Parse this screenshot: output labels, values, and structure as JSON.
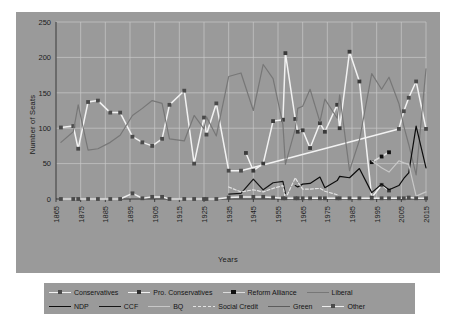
{
  "chart_data": {
    "type": "line",
    "title": "",
    "xlabel": "Years",
    "ylabel": "Number of Seats",
    "xlim": [
      1865,
      2015
    ],
    "ylim": [
      0,
      250
    ],
    "yticks": [
      0,
      50,
      100,
      150,
      200,
      250
    ],
    "xticks": [
      1865,
      1875,
      1885,
      1895,
      1905,
      1915,
      1925,
      1935,
      1945,
      1955,
      1965,
      1975,
      1985,
      1995,
      2005,
      2015
    ],
    "grid": true,
    "legend_position": "bottom",
    "background_color": "#9a9a9a",
    "series": [
      {
        "name": "Conservatives",
        "color": "#f2f2f2",
        "marker": "square",
        "marker_color": "#4a4a4a",
        "style": "solid",
        "x": [
          1867,
          1872,
          1874,
          1878,
          1882,
          1887,
          1891,
          1896,
          1900,
          1904,
          1908,
          1911,
          1917,
          1921,
          1925,
          1926,
          1930,
          1935,
          1940,
          2004,
          2006,
          2008,
          2011,
          2015
        ],
        "y": [
          101,
          103,
          71,
          137,
          139,
          122,
          122,
          88,
          80,
          75,
          85,
          133,
          153,
          50,
          115,
          91,
          135,
          40,
          40,
          99,
          124,
          143,
          166,
          99
        ]
      },
      {
        "name": "Pro. Conservatives",
        "color": "#f2f2f2",
        "marker": "square",
        "marker_color": "#3a3a3a",
        "style": "solid",
        "x": [
          1942,
          1945,
          1949,
          1953,
          1957,
          1958,
          1962,
          1963,
          1965,
          1968,
          1972,
          1974,
          1979,
          1980,
          1984,
          1988,
          1993,
          1997,
          2000
        ],
        "y": [
          65,
          40,
          50,
          110,
          112,
          206,
          113,
          95,
          97,
          72,
          107,
          95,
          133,
          100,
          208,
          166,
          2,
          20,
          12
        ]
      },
      {
        "name": "Reform Alliance",
        "color": "#dcdcdc",
        "marker": "square",
        "marker_color": "#101010",
        "style": "solid",
        "x": [
          1993,
          1997,
          2000
        ],
        "y": [
          52,
          60,
          66
        ]
      },
      {
        "name": "Liberal",
        "color": "#777777",
        "marker": "none",
        "style": "solid",
        "x": [
          1867,
          1872,
          1874,
          1878,
          1882,
          1887,
          1891,
          1896,
          1900,
          1904,
          1908,
          1911,
          1917,
          1921,
          1925,
          1926,
          1930,
          1935,
          1940,
          1945,
          1949,
          1953,
          1957,
          1958,
          1962,
          1963,
          1965,
          1968,
          1972,
          1974,
          1979,
          1980,
          1984,
          1988,
          1993,
          1997,
          2000,
          2004,
          2006,
          2008,
          2011,
          2015
        ],
        "y": [
          80,
          95,
          133,
          69,
          71,
          80,
          90,
          118,
          128,
          139,
          135,
          85,
          82,
          118,
          99,
          116,
          89,
          173,
          178,
          125,
          190,
          170,
          105,
          49,
          99,
          128,
          131,
          155,
          109,
          141,
          114,
          147,
          40,
          83,
          177,
          155,
          172,
          135,
          103,
          77,
          34,
          184
        ]
      },
      {
        "name": "NDP",
        "color": "#0d0d0d",
        "marker": "none",
        "style": "solid",
        "x": [
          1962,
          1963,
          1965,
          1968,
          1972,
          1974,
          1979,
          1980,
          1984,
          1988,
          1993,
          1997,
          2000,
          2004,
          2006,
          2008,
          2011,
          2015
        ],
        "y": [
          19,
          17,
          21,
          22,
          31,
          16,
          26,
          32,
          30,
          43,
          9,
          21,
          13,
          19,
          29,
          37,
          103,
          44
        ]
      },
      {
        "name": "CCF",
        "color": "#161616",
        "marker": "none",
        "style": "solid",
        "x": [
          1935,
          1940,
          1945,
          1949,
          1953,
          1957,
          1958
        ],
        "y": [
          7,
          8,
          28,
          13,
          23,
          25,
          8
        ]
      },
      {
        "name": "BQ",
        "color": "#c8c8c8",
        "marker": "none",
        "style": "solid",
        "x": [
          1993,
          1997,
          2000,
          2004,
          2006,
          2008,
          2011,
          2015
        ],
        "y": [
          54,
          44,
          38,
          54,
          51,
          49,
          4,
          10
        ]
      },
      {
        "name": "Social Credit",
        "color": "#e4e4e4",
        "marker": "none",
        "style": "dashed",
        "x": [
          1935,
          1940,
          1945,
          1949,
          1953,
          1957,
          1958,
          1962,
          1963,
          1965,
          1968,
          1972,
          1974,
          1979,
          1980
        ],
        "y": [
          17,
          10,
          13,
          10,
          15,
          19,
          0,
          30,
          24,
          14,
          14,
          15,
          11,
          6,
          0
        ]
      },
      {
        "name": "Green",
        "color": "#5c5c5c",
        "marker": "none",
        "style": "solid",
        "x": [
          2008,
          2011,
          2015
        ],
        "y": [
          0,
          1,
          1
        ]
      },
      {
        "name": "Other",
        "color": "#ededed",
        "marker": "square",
        "marker_color": "#4a4a4a",
        "style": "solid",
        "x": [
          1867,
          1872,
          1874,
          1878,
          1882,
          1887,
          1891,
          1896,
          1900,
          1904,
          1908,
          1911,
          1917,
          1921,
          1925,
          1926,
          1930,
          1935,
          1940,
          1945,
          1949,
          1953,
          1957,
          1958,
          1962,
          1963,
          1965,
          1968,
          1972,
          1974,
          1979,
          1980,
          1984,
          1988,
          1993,
          1997,
          2000,
          2004,
          2006,
          2008,
          2011,
          2015
        ],
        "y": [
          0,
          0,
          0,
          0,
          0,
          0,
          0,
          8,
          1,
          3,
          3,
          0,
          0,
          0,
          0,
          0,
          0,
          2,
          3,
          3,
          3,
          2,
          1,
          1,
          1,
          1,
          1,
          1,
          1,
          1,
          1,
          1,
          1,
          1,
          1,
          1,
          1,
          1,
          1,
          2,
          1,
          1
        ]
      }
    ]
  },
  "axes": {
    "y_title": "Number of Seats",
    "x_title": "Years",
    "y_ticks": [
      "0",
      "50",
      "100",
      "150",
      "200",
      "250"
    ],
    "x_ticks": [
      "1865",
      "1875",
      "1885",
      "1895",
      "1905",
      "1915",
      "1925",
      "1935",
      "1945",
      "1955",
      "1965",
      "1975",
      "1985",
      "1995",
      "2005",
      "2015"
    ]
  },
  "legend": {
    "row1": [
      {
        "label": "Conservatives",
        "color": "#f2f2f2",
        "marker_color": "#4a4a4a",
        "has_marker": true,
        "dashed": false
      },
      {
        "label": "Pro. Conservatives",
        "color": "#f2f2f2",
        "marker_color": "#2e2e2e",
        "has_marker": true,
        "dashed": false
      },
      {
        "label": "Reform Alliance",
        "color": "#dcdcdc",
        "marker_color": "#101010",
        "has_marker": true,
        "dashed": false
      },
      {
        "label": "Liberal",
        "color": "#777777",
        "marker_color": "#777777",
        "has_marker": false,
        "dashed": false
      }
    ],
    "row2": [
      {
        "label": "NDP",
        "color": "#0d0d0d",
        "marker_color": "#0d0d0d",
        "has_marker": false,
        "dashed": false
      },
      {
        "label": "CCF",
        "color": "#161616",
        "marker_color": "#161616",
        "has_marker": false,
        "dashed": false
      },
      {
        "label": "BQ",
        "color": "#c8c8c8",
        "marker_color": "#c8c8c8",
        "has_marker": false,
        "dashed": false
      },
      {
        "label": "Social Credit",
        "color": "#e4e4e4",
        "marker_color": "#e4e4e4",
        "has_marker": false,
        "dashed": true
      },
      {
        "label": "Green",
        "color": "#5c5c5c",
        "marker_color": "#5c5c5c",
        "has_marker": false,
        "dashed": false
      },
      {
        "label": "Other",
        "color": "#ededed",
        "marker_color": "#4a4a4a",
        "has_marker": true,
        "dashed": false
      }
    ]
  },
  "caption": ""
}
